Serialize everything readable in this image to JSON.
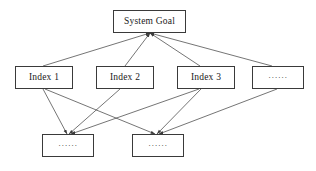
{
  "diagram": {
    "background_color": "#ffffff",
    "line_color": "#3a3a3a",
    "text_color": "#1a1a1a",
    "width": 316,
    "height": 171,
    "nodes": [
      {
        "id": "system-goal",
        "label": "System Goal",
        "level": "goal",
        "x": 113,
        "y": 10,
        "w": 73,
        "h": 23
      },
      {
        "id": "index-1",
        "label": "Index 1",
        "level": "index",
        "x": 15,
        "y": 66,
        "w": 58,
        "h": 23
      },
      {
        "id": "index-2",
        "label": "Index 2",
        "level": "index",
        "x": 96,
        "y": 66,
        "w": 58,
        "h": 23
      },
      {
        "id": "index-3",
        "label": "Index 3",
        "level": "index",
        "x": 177,
        "y": 66,
        "w": 58,
        "h": 23
      },
      {
        "id": "index-more",
        "label": "······",
        "level": "index",
        "x": 252,
        "y": 66,
        "w": 52,
        "h": 23
      },
      {
        "id": "sub-more-1",
        "label": "······",
        "level": "sub",
        "x": 42,
        "y": 134,
        "w": 52,
        "h": 23
      },
      {
        "id": "sub-more-2",
        "label": "······",
        "level": "sub",
        "x": 132,
        "y": 134,
        "w": 52,
        "h": 23
      }
    ],
    "edges": [
      {
        "from": "index-1",
        "to": "system-goal",
        "x1": 43,
        "y1": 66,
        "x2": 150,
        "y2": 33
      },
      {
        "from": "index-2",
        "to": "system-goal",
        "x1": 125,
        "y1": 66,
        "x2": 150,
        "y2": 33
      },
      {
        "from": "index-3",
        "to": "system-goal",
        "x1": 200,
        "y1": 66,
        "x2": 150,
        "y2": 33
      },
      {
        "from": "index-more",
        "to": "system-goal",
        "x1": 272,
        "y1": 66,
        "x2": 150,
        "y2": 33
      },
      {
        "from": "index-1",
        "to": "sub-more-1",
        "x1": 43,
        "y1": 89,
        "x2": 67,
        "y2": 134
      },
      {
        "from": "index-1",
        "to": "sub-more-2",
        "x1": 45,
        "y1": 89,
        "x2": 155,
        "y2": 134
      },
      {
        "from": "index-2",
        "to": "sub-more-1",
        "x1": 120,
        "y1": 89,
        "x2": 69,
        "y2": 134
      },
      {
        "from": "index-3",
        "to": "sub-more-1",
        "x1": 199,
        "y1": 89,
        "x2": 71,
        "y2": 134
      },
      {
        "from": "index-3",
        "to": "sub-more-2",
        "x1": 201,
        "y1": 89,
        "x2": 157,
        "y2": 134
      },
      {
        "from": "index-more",
        "to": "sub-more-2",
        "x1": 277,
        "y1": 89,
        "x2": 159,
        "y2": 134
      }
    ]
  }
}
